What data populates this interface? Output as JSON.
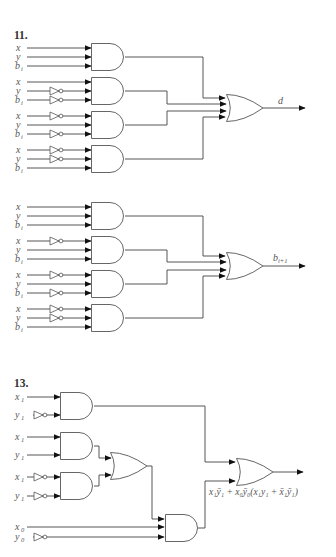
{
  "problems": [
    {
      "number": "11.",
      "circuits": [
        {
          "output_label": "d",
          "and_gates": [
            {
              "inputs": [
                {
                  "name": "x",
                  "inverted": false
                },
                {
                  "name": "y",
                  "inverted": false
                },
                {
                  "name": "b_i",
                  "inverted": false
                }
              ]
            },
            {
              "inputs": [
                {
                  "name": "x",
                  "inverted": false
                },
                {
                  "name": "y",
                  "inverted": true
                },
                {
                  "name": "b_i",
                  "inverted": true
                }
              ]
            },
            {
              "inputs": [
                {
                  "name": "x",
                  "inverted": true
                },
                {
                  "name": "y",
                  "inverted": false
                },
                {
                  "name": "b_i",
                  "inverted": true
                }
              ]
            },
            {
              "inputs": [
                {
                  "name": "x",
                  "inverted": true
                },
                {
                  "name": "y",
                  "inverted": true
                },
                {
                  "name": "b_i",
                  "inverted": false
                }
              ]
            }
          ],
          "or_gate": {
            "inputs": 4
          }
        },
        {
          "output_label": "b_{i+1}",
          "and_gates": [
            {
              "inputs": [
                {
                  "name": "x",
                  "inverted": false
                },
                {
                  "name": "y",
                  "inverted": false
                },
                {
                  "name": "b_i",
                  "inverted": false
                }
              ]
            },
            {
              "inputs": [
                {
                  "name": "x",
                  "inverted": true
                },
                {
                  "name": "y",
                  "inverted": false
                },
                {
                  "name": "b_i",
                  "inverted": false
                }
              ]
            },
            {
              "inputs": [
                {
                  "name": "x",
                  "inverted": true
                },
                {
                  "name": "y",
                  "inverted": false
                },
                {
                  "name": "b_i",
                  "inverted": true
                }
              ]
            },
            {
              "inputs": [
                {
                  "name": "x",
                  "inverted": true
                },
                {
                  "name": "y",
                  "inverted": true
                },
                {
                  "name": "b_i",
                  "inverted": false
                }
              ]
            }
          ],
          "or_gate": {
            "inputs": 4
          }
        }
      ]
    },
    {
      "number": "13.",
      "circuits": [
        {
          "output_label": "x1ȳ1 + x0ȳ0(x1y1 + x̄1ȳ1)",
          "gates": [
            {
              "type": "AND",
              "inputs": [
                {
                  "name": "x_1",
                  "inverted": false
                },
                {
                  "name": "y_1",
                  "inverted": true
                }
              ]
            },
            {
              "type": "AND",
              "inputs": [
                {
                  "name": "x_1",
                  "inverted": false
                },
                {
                  "name": "y_1",
                  "inverted": false
                }
              ]
            },
            {
              "type": "AND",
              "inputs": [
                {
                  "name": "x_1",
                  "inverted": true
                },
                {
                  "name": "y_1",
                  "inverted": true
                }
              ]
            },
            {
              "type": "OR",
              "inputs": [
                "AND2",
                "AND3"
              ]
            },
            {
              "type": "AND",
              "inputs": [
                "OR",
                "x_0",
                "NOT y_0"
              ]
            },
            {
              "type": "OR",
              "inputs": [
                "AND1",
                "AND4"
              ]
            }
          ]
        }
      ]
    }
  ],
  "labels": {
    "p11": "11.",
    "p13": "13.",
    "d": "d",
    "bi1_main": "b",
    "bi1_sub": "i+1",
    "x": "x",
    "y": "y",
    "b": "b",
    "i": "i",
    "x1": "x",
    "y1": "y",
    "one": "1",
    "x0": "x",
    "y0": "y",
    "zero": "0",
    "final_expr": "x₁ȳ₁ + x₀ȳ₀(x₁y₁ + x̄₁ȳ₁)"
  }
}
